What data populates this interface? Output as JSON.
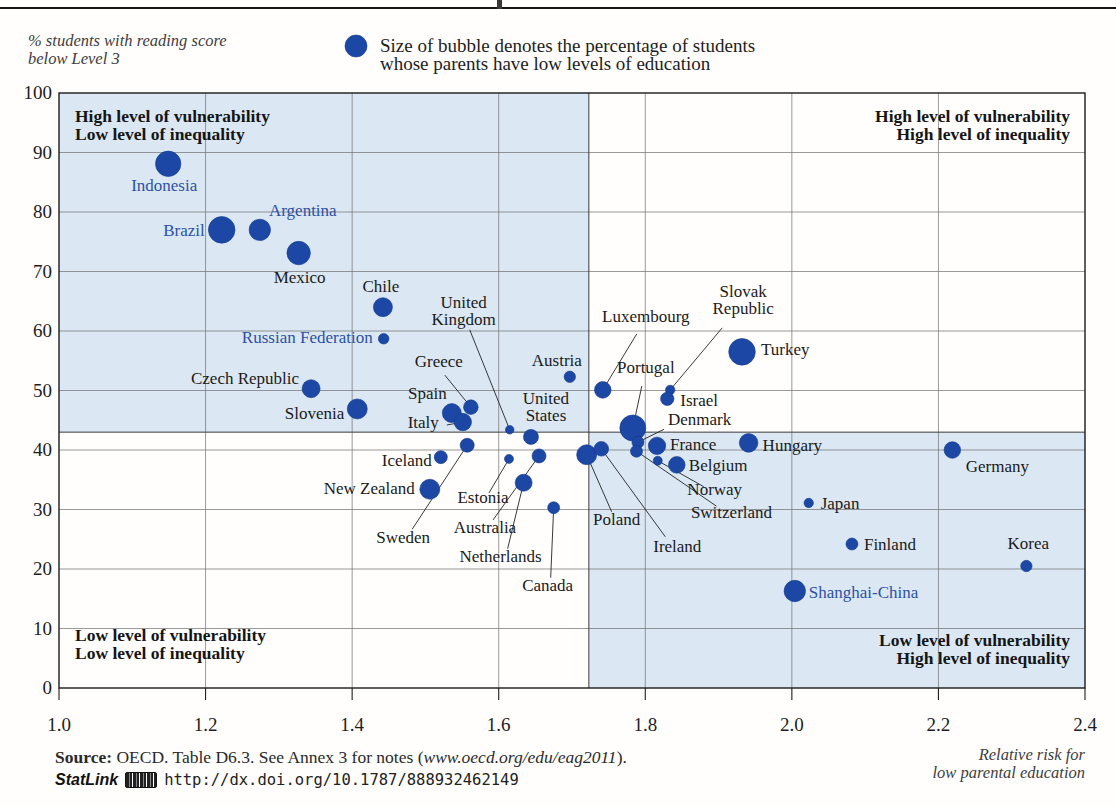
{
  "colors": {
    "bubble": "#1c47a5",
    "bubble_stroke": "#123a8c",
    "partner_label": "#2b51a5",
    "oecd_label": "#1a1a1a",
    "quadrant_shade": "#dbe8f3",
    "gridline": "#6f6f6f",
    "border": "#1a1a1a"
  },
  "legend": {
    "bubble_icon": "legend-bubble",
    "line1": "Size of bubble denotes the percentage of students",
    "line2": "whose parents have low levels of education"
  },
  "source": {
    "bold": "Source:",
    "text_before_link": " OECD. Table D6.3. See Annex 3 for notes (",
    "link": "www.oecd.org/edu/eag2011",
    "text_after_link": ").",
    "statlink_label": "StatLink",
    "statlink_url": "http://dx.doi.org/10.1787/888932462149"
  },
  "chart_data": {
    "type": "scatter",
    "title": "",
    "x_axis": {
      "label": "Relative risk for low parental education",
      "label_lines": [
        "Relative risk for",
        "low parental education"
      ],
      "min": 1.0,
      "max": 2.4,
      "ticks": [
        [
          1.0,
          "1.0"
        ],
        [
          1.2,
          "1.2"
        ],
        [
          1.4,
          "1.4"
        ],
        [
          1.6,
          "1.6"
        ],
        [
          1.8,
          "1.8"
        ],
        [
          2.0,
          "2.0"
        ],
        [
          2.2,
          "2.2"
        ],
        [
          2.4,
          "2.4"
        ]
      ]
    },
    "y_axis": {
      "label": "% students with reading score below Level 3",
      "label_lines": [
        "% students with reading score",
        "below Level 3"
      ],
      "min": 0,
      "max": 100,
      "ticks": [
        [
          0,
          "0"
        ],
        [
          10,
          "10"
        ],
        [
          20,
          "20"
        ],
        [
          30,
          "30"
        ],
        [
          40,
          "40"
        ],
        [
          50,
          "50"
        ],
        [
          60,
          "60"
        ],
        [
          70,
          "70"
        ],
        [
          80,
          "80"
        ],
        [
          90,
          "90"
        ],
        [
          100,
          "100"
        ]
      ]
    },
    "grid": true,
    "quadrant_boundary": {
      "x": 1.723,
      "y": 43
    },
    "quadrant_labels": {
      "top_left": [
        "High level of vulnerability",
        "Low level of inequality"
      ],
      "top_right": [
        "High level of vulnerability",
        "High level of inequality"
      ],
      "bottom_left": [
        "Low level of vulnerability",
        "Low level of inequality"
      ],
      "bottom_right": [
        "Low level of vulnerability",
        "High level of inequality"
      ]
    },
    "bubble_size_note": "Size of bubble denotes the percentage of students whose parents have low levels of education",
    "points": [
      {
        "name": "Indonesia",
        "x": 1.149,
        "y": 88.1,
        "r": 12.7,
        "partner": true,
        "lx": -4,
        "ly": 27,
        "a": "m"
      },
      {
        "name": "Brazil",
        "x": 1.222,
        "y": 77.0,
        "r": 13.3,
        "partner": true,
        "lx": -17,
        "ly": 6,
        "a": "e"
      },
      {
        "name": "Argentina",
        "x": 1.274,
        "y": 77.0,
        "r": 10.7,
        "partner": true,
        "lx": 43,
        "ly": -14,
        "a": "m"
      },
      {
        "name": "Mexico",
        "x": 1.327,
        "y": 73.1,
        "r": 11.7,
        "partner": false,
        "lx": 1,
        "ly": 30,
        "a": "m"
      },
      {
        "name": "Chile",
        "x": 1.442,
        "y": 64.0,
        "r": 9.5,
        "partner": false,
        "lx": -2,
        "ly": -15,
        "a": "m"
      },
      {
        "name": "Russian Federation",
        "x": 1.443,
        "y": 58.7,
        "r": 5.3,
        "partner": true,
        "lx": -11,
        "ly": 4,
        "a": "e"
      },
      {
        "name": "Czech Republic",
        "x": 1.344,
        "y": 50.3,
        "r": 9.0,
        "partner": false,
        "lx": -12,
        "ly": -5,
        "a": "e"
      },
      {
        "name": "Slovenia",
        "x": 1.407,
        "y": 46.9,
        "r": 10.0,
        "partner": false,
        "lx": -13,
        "ly": 10,
        "a": "e"
      },
      {
        "name": "Greece",
        "x": 1.562,
        "y": 47.2,
        "r": 7.3,
        "partner": false,
        "lx": -32,
        "ly": -40,
        "a": "m",
        "leader": [
          -26,
          -32
        ]
      },
      {
        "name": "Spain",
        "x": 1.536,
        "y": 46.2,
        "r": 9.5,
        "partner": false,
        "lx": -5,
        "ly": -14,
        "a": "e"
      },
      {
        "name": "Italy",
        "x": 1.551,
        "y": 44.7,
        "r": 8.7,
        "partner": false,
        "lx": -24,
        "ly": 6,
        "a": "e",
        "leader": [
          -16,
          3
        ]
      },
      {
        "name": "United\nKingdom",
        "x": 1.615,
        "y": 43.4,
        "r": 4.3,
        "partner": false,
        "lx": -46,
        "ly": -122,
        "a": "m",
        "leader": [
          -40,
          -100
        ]
      },
      {
        "name": "Austria",
        "x": 1.697,
        "y": 52.3,
        "r": 5.7,
        "partner": false,
        "lx": -13,
        "ly": -11,
        "a": "m"
      },
      {
        "name": "United\nStates",
        "x": 1.644,
        "y": 42.2,
        "r": 7.5,
        "partner": false,
        "lx": 15,
        "ly": -33,
        "a": "m"
      },
      {
        "name": "Sweden",
        "x": 1.557,
        "y": 40.8,
        "r": 7.0,
        "partner": false,
        "lx": -64,
        "ly": 98,
        "a": "m",
        "leader": [
          -55,
          84
        ]
      },
      {
        "name": "Iceland",
        "x": 1.521,
        "y": 38.8,
        "r": 6.5,
        "partner": false,
        "lx": -9,
        "ly": 9,
        "a": "e"
      },
      {
        "name": "New Zealand",
        "x": 1.506,
        "y": 33.4,
        "r": 10.0,
        "partner": false,
        "lx": -15,
        "ly": 5,
        "a": "e"
      },
      {
        "name": "Estonia",
        "x": 1.614,
        "y": 38.5,
        "r": 4.5,
        "partner": false,
        "lx": -26,
        "ly": 44,
        "a": "m",
        "leader": [
          -20,
          34
        ]
      },
      {
        "name": "Australia",
        "x": 1.655,
        "y": 39.0,
        "r": 7.0,
        "partner": false,
        "lx": -54,
        "ly": 77,
        "a": "m",
        "leader": [
          -46,
          64
        ]
      },
      {
        "name": "Netherlands",
        "x": 1.634,
        "y": 34.5,
        "r": 8.5,
        "partner": false,
        "lx": -23,
        "ly": 79,
        "a": "m",
        "leader": [
          -16,
          66
        ]
      },
      {
        "name": "Canada",
        "x": 1.675,
        "y": 30.3,
        "r": 6.0,
        "partner": false,
        "lx": -6,
        "ly": 83,
        "a": "m",
        "leader": [
          -3,
          70
        ]
      },
      {
        "name": "Poland",
        "x": 1.72,
        "y": 39.2,
        "r": 10.0,
        "partner": false,
        "lx": 30,
        "ly": 70,
        "a": "m",
        "leader": [
          25,
          57
        ]
      },
      {
        "name": "Ireland",
        "x": 1.74,
        "y": 40.2,
        "r": 7.3,
        "partner": false,
        "lx": 76,
        "ly": 103,
        "a": "m",
        "leader": [
          64,
          88
        ]
      },
      {
        "name": "Luxembourg",
        "x": 1.742,
        "y": 50.1,
        "r": 8.3,
        "partner": false,
        "lx": 43,
        "ly": -68,
        "a": "m",
        "leader": [
          34,
          -56
        ]
      },
      {
        "name": "Portugal",
        "x": 1.783,
        "y": 43.7,
        "r": 13.0,
        "partner": false,
        "lx": 13,
        "ly": -55,
        "a": "m",
        "leader": [
          9,
          -42
        ]
      },
      {
        "name": "Denmark",
        "x": 1.79,
        "y": 41.3,
        "r": 6.0,
        "partner": false,
        "lx": 30,
        "ly": -17,
        "a": "s",
        "leader": [
          26,
          -13
        ]
      },
      {
        "name": "Switzerland",
        "x": 1.788,
        "y": 39.8,
        "r": 6.0,
        "partner": false,
        "lx": 95,
        "ly": 67,
        "a": "m",
        "leader": [
          80,
          55
        ]
      },
      {
        "name": "France",
        "x": 1.816,
        "y": 40.7,
        "r": 8.7,
        "partner": false,
        "lx": 13,
        "ly": 4,
        "a": "s"
      },
      {
        "name": "Norway",
        "x": 1.817,
        "y": 38.2,
        "r": 4.5,
        "partner": false,
        "lx": 57,
        "ly": 34,
        "a": "m",
        "leader": [
          46,
          26
        ]
      },
      {
        "name": "Slovak\nRepublic",
        "x": 1.834,
        "y": 50.1,
        "r": 4.7,
        "partner": false,
        "lx": 73,
        "ly": -93,
        "a": "m",
        "leader": [
          52,
          -62
        ]
      },
      {
        "name": "Israel",
        "x": 1.83,
        "y": 48.6,
        "r": 6.7,
        "partner": false,
        "lx": 13,
        "ly": 7,
        "a": "s"
      },
      {
        "name": "Belgium",
        "x": 1.843,
        "y": 37.5,
        "r": 8.3,
        "partner": false,
        "lx": 12,
        "ly": 6,
        "a": "s"
      },
      {
        "name": "Turkey",
        "x": 1.932,
        "y": 56.5,
        "r": 13.3,
        "partner": false,
        "lx": 19,
        "ly": 3,
        "a": "s"
      },
      {
        "name": "Hungary",
        "x": 1.941,
        "y": 41.2,
        "r": 9.3,
        "partner": false,
        "lx": 14,
        "ly": 8,
        "a": "s"
      },
      {
        "name": "Germany",
        "x": 2.219,
        "y": 40.0,
        "r": 8.3,
        "partner": false,
        "lx": 45,
        "ly": 22,
        "a": "m"
      },
      {
        "name": "Japan",
        "x": 2.023,
        "y": 31.1,
        "r": 4.7,
        "partner": false,
        "lx": 12,
        "ly": 6,
        "a": "s"
      },
      {
        "name": "Finland",
        "x": 2.082,
        "y": 24.2,
        "r": 6.0,
        "partner": false,
        "lx": 12,
        "ly": 6,
        "a": "s"
      },
      {
        "name": "Korea",
        "x": 2.32,
        "y": 20.5,
        "r": 5.7,
        "partner": false,
        "lx": 2,
        "ly": -17,
        "a": "m"
      },
      {
        "name": "Shanghai-China",
        "x": 2.004,
        "y": 16.3,
        "r": 10.7,
        "partner": true,
        "lx": 14,
        "ly": 7,
        "a": "s"
      }
    ]
  }
}
